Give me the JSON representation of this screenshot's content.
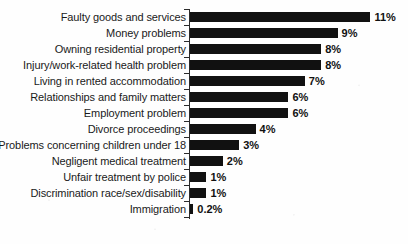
{
  "chart_data": {
    "type": "bar",
    "orientation": "horizontal",
    "title": "",
    "subtitle": "",
    "xlabel": "",
    "ylabel": "",
    "grid": false,
    "legend": false,
    "axis": {
      "value_axis_range": [
        0,
        11
      ],
      "ticks_shown": false,
      "category_axis_line": true,
      "category_tick_marks": true
    },
    "value_suffix": "%",
    "bar_color": "#111111",
    "categories": [
      "Faulty goods and services",
      "Money problems",
      "Owning residential property",
      "Injury/work-related health problem",
      "Living in rented accommodation",
      "Relationships and family matters",
      "Employment problem",
      "Divorce proceedings",
      "Problems concerning children under 18",
      "Negligent medical treatment",
      "Unfair treatment by police",
      "Discrimination race/sex/disability",
      "Immigration"
    ],
    "values": [
      11,
      9,
      8,
      8,
      7,
      6,
      6,
      4,
      3,
      2,
      1,
      1,
      0.2
    ],
    "value_labels": [
      "11%",
      "9%",
      "8%",
      "8%",
      "7%",
      "6%",
      "6%",
      "4%",
      "3%",
      "2%",
      "1%",
      "1%",
      "0.2%"
    ]
  }
}
